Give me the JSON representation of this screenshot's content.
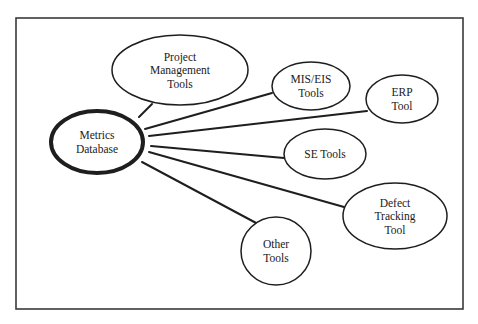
{
  "diagram": {
    "frame": {
      "x": 16,
      "y": 18,
      "width": 447,
      "height": 291,
      "stroke": "#3a3a3a"
    },
    "hub": {
      "id": "metrics-database",
      "lines": [
        "Metrics",
        "Database"
      ],
      "cx": 97,
      "cy": 142,
      "rx": 46,
      "ry": 31,
      "stroke_width": 4
    },
    "nodes": [
      {
        "id": "project-management-tools",
        "lines": [
          "Project",
          "Management",
          "Tools"
        ],
        "cx": 180,
        "cy": 70,
        "rx": 68,
        "ry": 35
      },
      {
        "id": "mis-eis-tools",
        "lines": [
          "MIS/EIS",
          "Tools"
        ],
        "cx": 311,
        "cy": 86,
        "rx": 39,
        "ry": 24
      },
      {
        "id": "erp-tool",
        "lines": [
          "ERP",
          "Tool"
        ],
        "cx": 402,
        "cy": 99,
        "rx": 36,
        "ry": 24
      },
      {
        "id": "se-tools",
        "lines": [
          "SE Tools"
        ],
        "cx": 325,
        "cy": 154,
        "rx": 41,
        "ry": 25
      },
      {
        "id": "defect-tracking-tool",
        "lines": [
          "Defect",
          "Tracking",
          "Tool"
        ],
        "cx": 395,
        "cy": 216,
        "rx": 52,
        "ry": 33
      },
      {
        "id": "other-tools",
        "lines": [
          "Other",
          "Tools"
        ],
        "cx": 276,
        "cy": 251,
        "rx": 35,
        "ry": 34
      }
    ],
    "edges": [
      {
        "from": "metrics-database",
        "to": "project-management-tools",
        "x1": 139,
        "y1": 117,
        "x2": 152,
        "y2": 104
      },
      {
        "from": "metrics-database",
        "to": "mis-eis-tools",
        "x1": 145,
        "y1": 129,
        "x2": 272,
        "y2": 93
      },
      {
        "from": "metrics-database",
        "to": "erp-tool",
        "x1": 149,
        "y1": 136,
        "x2": 367,
        "y2": 111
      },
      {
        "from": "metrics-database",
        "to": "se-tools",
        "x1": 151,
        "y1": 146,
        "x2": 284,
        "y2": 158
      },
      {
        "from": "metrics-database",
        "to": "defect-tracking-tool",
        "x1": 149,
        "y1": 152,
        "x2": 344,
        "y2": 207
      },
      {
        "from": "metrics-database",
        "to": "other-tools",
        "x1": 142,
        "y1": 162,
        "x2": 258,
        "y2": 224
      }
    ],
    "colors": {
      "line": "#1e1e1e",
      "node_fill": "#ffffff",
      "background": "#ffffff"
    }
  }
}
